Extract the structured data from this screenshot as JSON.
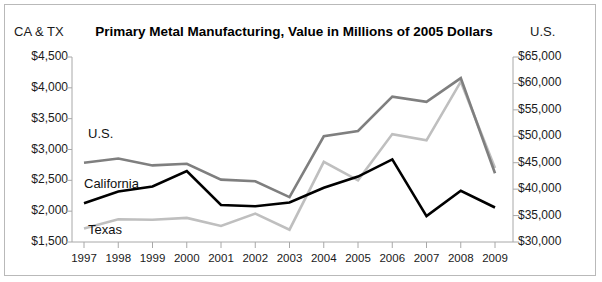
{
  "chart_data": {
    "type": "line",
    "title": "Primary Metal Manufacturing, Value in Millions of 2005 Dollars",
    "xlabel": "",
    "left_axis_label": "CA & TX",
    "right_axis_label": "U.S.",
    "grid": false,
    "legend_position": "inline-labels",
    "categories": [
      "1997",
      "1998",
      "1999",
      "2000",
      "2001",
      "2002",
      "2003",
      "2004",
      "2005",
      "2006",
      "2007",
      "2008",
      "2009"
    ],
    "left_ylim": [
      1500,
      4500
    ],
    "left_yticks": [
      "$1,500",
      "$2,000",
      "$2,500",
      "$3,000",
      "$3,500",
      "$4,000",
      "$4,500"
    ],
    "left_ytick_values": [
      1500,
      2000,
      2500,
      3000,
      3500,
      4000,
      4500
    ],
    "right_ylim": [
      30000,
      65000
    ],
    "right_yticks": [
      "$30,000",
      "$35,000",
      "$40,000",
      "$45,000",
      "$50,000",
      "$55,000",
      "$60,000",
      "$65,000"
    ],
    "right_ytick_values": [
      30000,
      35000,
      40000,
      45000,
      50000,
      55000,
      60000,
      65000
    ],
    "series": [
      {
        "name": "U.S.",
        "axis": "right",
        "color": "#7f7f7f",
        "label_x": "1998",
        "values": [
          45000,
          45800,
          44500,
          44800,
          41800,
          41500,
          38500,
          50000,
          51000,
          57500,
          56500,
          61000,
          43000
        ]
      },
      {
        "name": "California",
        "axis": "left",
        "color": "#000000",
        "label_x": "1998",
        "values": [
          2130,
          2320,
          2400,
          2650,
          2100,
          2080,
          2140,
          2380,
          2560,
          2840,
          1920,
          2330,
          2060
        ]
      },
      {
        "name": "Texas",
        "axis": "left",
        "color": "#bfbfbf",
        "label_x": "1998",
        "values": [
          1720,
          1870,
          1860,
          1890,
          1760,
          1960,
          1700,
          2800,
          2500,
          3250,
          3150,
          4100,
          2700
        ]
      }
    ]
  }
}
